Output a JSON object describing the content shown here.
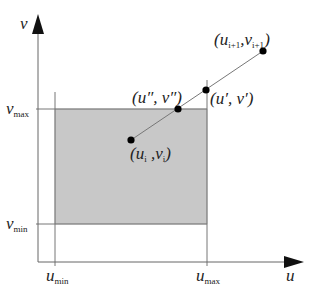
{
  "diagram": {
    "type": "line-clipping-against-rectangle",
    "axes": {
      "x_label": "u",
      "y_label": "v"
    },
    "bounds": {
      "u_min": {
        "base": "u",
        "sub": "min"
      },
      "u_max": {
        "base": "u",
        "sub": "max"
      },
      "v_min": {
        "base": "v",
        "sub": "min"
      },
      "v_max": {
        "base": "v",
        "sub": "max"
      }
    },
    "region_color": "#c8c8c8",
    "points": [
      {
        "id": "start",
        "label": "(u_i, v_i)",
        "display": {
          "open": "(",
          "base1": "u",
          "sub1": "i",
          "sep": " ,",
          "base2": "v",
          "sub2": "i",
          "close": ")"
        }
      },
      {
        "id": "intersect-top",
        "label": "(u″, v″)",
        "display": {
          "text": "(u″, v″)"
        }
      },
      {
        "id": "intersect-right",
        "label": "(u′, v′)",
        "display": {
          "text": "(u′, v′)"
        }
      },
      {
        "id": "end",
        "label": "(u_{i+1}, v_{i+1})",
        "display": {
          "open": "(",
          "base1": "u",
          "sub1": "i+1",
          "sep": ",",
          "base2": "v",
          "sub2": "i+1",
          "close": ")"
        }
      }
    ]
  }
}
